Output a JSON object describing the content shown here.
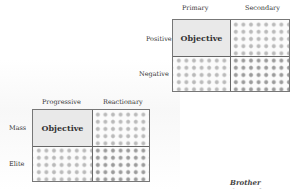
{
  "top_matrix": {
    "col_headers": [
      "Primary",
      "Secondary"
    ],
    "row_headers": [
      "Positive",
      "Negative"
    ],
    "highlight_cell": "Objective"
  },
  "bottom_matrix": {
    "col_headers": [
      "Progressive",
      "Reactionary"
    ],
    "row_headers": [
      "Mass",
      "Elite"
    ],
    "highlight_cell": "Objective"
  },
  "signature": "Brother Omowale",
  "colors": {
    "border": "#777777",
    "objective_fill": "#e9e9e9",
    "dot": "#b9b9b9"
  }
}
